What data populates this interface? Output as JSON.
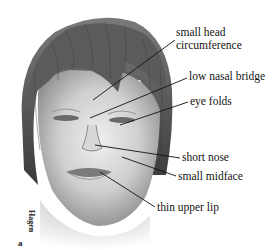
{
  "figure": {
    "signature": "Hagen",
    "panel_letter": "a",
    "labels": [
      {
        "id": "small-head-circumference",
        "lines": [
          "small head",
          "circumference"
        ]
      },
      {
        "id": "low-nasal-bridge",
        "text": "low nasal bridge"
      },
      {
        "id": "eye-folds",
        "text": "eye folds"
      },
      {
        "id": "short-nose",
        "text": "short nose"
      },
      {
        "id": "small-midface",
        "text": "small midface"
      },
      {
        "id": "thin-upper-lip",
        "text": "thin upper lip"
      }
    ]
  }
}
